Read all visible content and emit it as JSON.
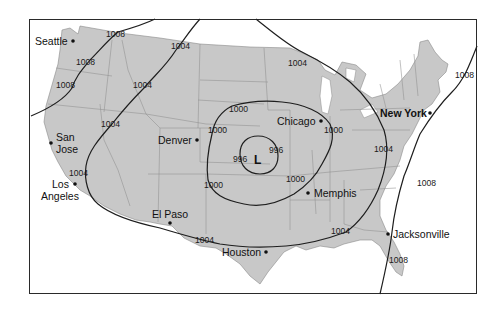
{
  "map": {
    "title": "",
    "low_center": {
      "label": "L",
      "x": 258,
      "y": 160
    },
    "colors": {
      "land": "#c8c8c8",
      "water": "#ffffff",
      "isobar": "#1e1e1e",
      "state_border": "#8f8f8f",
      "frame": "#2a2a2a"
    },
    "cities": [
      {
        "name": "Seattle",
        "x": 73,
        "y": 41,
        "bold": false
      },
      {
        "name": "San",
        "x": 51,
        "y": 143,
        "bold": false
      },
      {
        "name": "Jose",
        "x": 51,
        "y": 143,
        "bold": false
      },
      {
        "name": "Los",
        "x": 75,
        "y": 183,
        "bold": false
      },
      {
        "name": "Angeles",
        "x": 75,
        "y": 183,
        "bold": false
      },
      {
        "name": "Denver",
        "x": 196,
        "y": 140,
        "bold": false
      },
      {
        "name": "El Paso",
        "x": 170,
        "y": 223,
        "bold": false
      },
      {
        "name": "Houston",
        "x": 266,
        "y": 252,
        "bold": false
      },
      {
        "name": "Chicago",
        "x": 321,
        "y": 121,
        "bold": false
      },
      {
        "name": "Memphis",
        "x": 308,
        "y": 193,
        "bold": false
      },
      {
        "name": "New York",
        "x": 430,
        "y": 113,
        "bold": true
      },
      {
        "name": "Jacksonville",
        "x": 387,
        "y": 234,
        "bold": false
      }
    ],
    "isobar_labels": [
      {
        "value": "1008",
        "x": 116,
        "y": 35
      },
      {
        "value": "1008",
        "x": 86,
        "y": 63
      },
      {
        "value": "1008",
        "x": 65,
        "y": 86
      },
      {
        "value": "1004",
        "x": 181,
        "y": 46
      },
      {
        "value": "1004",
        "x": 143,
        "y": 85
      },
      {
        "value": "1004",
        "x": 111,
        "y": 124
      },
      {
        "value": "1004",
        "x": 91,
        "y": 173
      },
      {
        "value": "1004",
        "x": 300,
        "y": 63
      },
      {
        "value": "1004",
        "x": 384,
        "y": 149
      },
      {
        "value": "1004",
        "x": 211,
        "y": 240
      },
      {
        "value": "1004",
        "x": 341,
        "y": 231
      },
      {
        "value": "1008",
        "x": 465,
        "y": 76
      },
      {
        "value": "1008",
        "x": 426,
        "y": 184
      },
      {
        "value": "1008",
        "x": 399,
        "y": 260
      },
      {
        "value": "1000",
        "x": 232,
        "y": 109
      },
      {
        "value": "1000",
        "x": 218,
        "y": 131
      },
      {
        "value": "1000",
        "x": 334,
        "y": 130
      },
      {
        "value": "1000",
        "x": 213,
        "y": 186
      },
      {
        "value": "1000",
        "x": 297,
        "y": 180
      },
      {
        "value": "996",
        "x": 240,
        "y": 159
      },
      {
        "value": "996",
        "x": 277,
        "y": 150
      }
    ]
  }
}
